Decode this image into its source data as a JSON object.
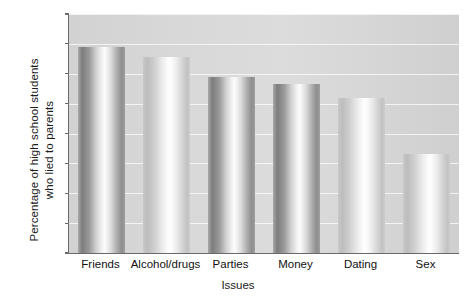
{
  "chart_data": {
    "type": "bar",
    "title": "",
    "categories": [
      "Friends",
      "Alcohol/drugs",
      "Parties",
      "Money",
      "Dating",
      "Sex"
    ],
    "values": [
      69,
      65.5,
      59,
      56.5,
      52,
      33
    ],
    "xlabel": "Issues",
    "ylabel_line1": "Percentage of high school students",
    "ylabel_line2": "who lied to parents",
    "ylim": [
      0,
      80
    ],
    "yticks": [
      0,
      10,
      20,
      30,
      40,
      50,
      60,
      70,
      80
    ],
    "ytick_labels": [
      "0",
      "10",
      "20",
      "30",
      "40",
      "50",
      "60",
      "70",
      "80"
    ],
    "grid": true,
    "legend": "none",
    "bar_style": "cylinder-gradient",
    "colors": {
      "plot_background": "#d8d8d8",
      "axis": "#6a6a6a",
      "gridline": "#ffffff",
      "bar_dark": "#7d7d7d",
      "bar_light": "#fcfcfc",
      "text": "#111111"
    }
  }
}
